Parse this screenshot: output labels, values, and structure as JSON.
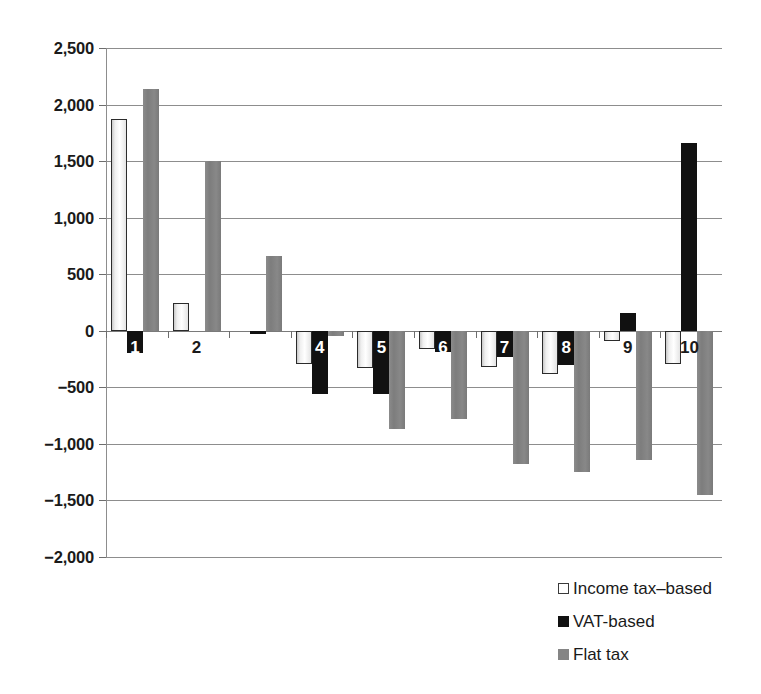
{
  "chart_data": {
    "type": "bar",
    "title": "",
    "subtitle": "",
    "xlabel": "",
    "ylabel": "",
    "grid": true,
    "legend_position": "bottom-right",
    "orientation": "vertical",
    "grouping": "grouped",
    "categories": [
      "1",
      "2",
      "3",
      "4",
      "5",
      "6",
      "7",
      "8",
      "9",
      "10"
    ],
    "ylim": [
      -2000,
      2500
    ],
    "ytick_step": 500,
    "ytick_labels": [
      "2,500",
      "2,000",
      "1,500",
      "1,000",
      "500",
      "0",
      "−500",
      "−1,000",
      "−1,500",
      "−2,000"
    ],
    "ytick_values": [
      2500,
      2000,
      1500,
      1000,
      500,
      0,
      -500,
      -1000,
      -1500,
      -2000
    ],
    "series": [
      {
        "name": "Income tax–based",
        "color": "#ffffff",
        "values": [
          1870,
          250,
          0,
          -290,
          -330,
          -160,
          -320,
          -385,
          -90,
          -290
        ]
      },
      {
        "name": "VAT-based",
        "color": "#111111",
        "values": [
          -200,
          0,
          -25,
          -560,
          -555,
          -190,
          -230,
          -300,
          155,
          1660
        ]
      },
      {
        "name": "Flat tax",
        "color": "#858585",
        "values": [
          2140,
          1500,
          660,
          -50,
          -870,
          -780,
          -1180,
          -1250,
          -1140,
          -1450
        ]
      }
    ]
  },
  "legend": {
    "items": [
      {
        "label": "Income tax–based",
        "swatch": "income"
      },
      {
        "label": "VAT-based",
        "swatch": "vat"
      },
      {
        "label": "Flat tax",
        "swatch": "flat"
      }
    ]
  }
}
